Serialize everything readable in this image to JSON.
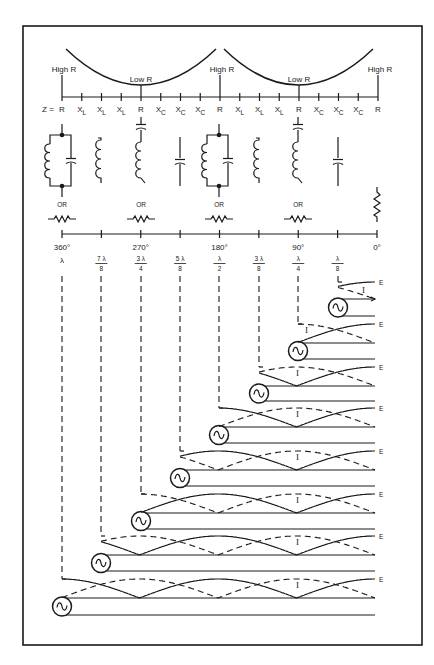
{
  "impedance_curve": {
    "high_label": "High R",
    "low_label": "Low R",
    "z_prefix": "Z =",
    "axis_labels": [
      "R",
      "X_L",
      "X_L",
      "X_L",
      "R",
      "X_C",
      "X_C",
      "X_C",
      "R",
      "X_L",
      "X_L",
      "X_L",
      "R",
      "X_C",
      "X_C",
      "X_C",
      "R"
    ]
  },
  "equivalents": {
    "or_label": "OR",
    "items": [
      {
        "position": "360°",
        "type": "parallel-LC",
        "alt": "resistor"
      },
      {
        "position": "315°",
        "type": "inductor"
      },
      {
        "position": "270°",
        "type": "series-LC",
        "alt": "resistor"
      },
      {
        "position": "225°",
        "type": "capacitor"
      },
      {
        "position": "180°",
        "type": "parallel-LC",
        "alt": "resistor"
      },
      {
        "position": "135°",
        "type": "inductor"
      },
      {
        "position": "90°",
        "type": "series-LC",
        "alt": "resistor"
      },
      {
        "position": "45°",
        "type": "capacitor"
      },
      {
        "position": "0°",
        "type": "resistor"
      }
    ]
  },
  "degree_axis": {
    "degrees": [
      "360°",
      "270°",
      "180°",
      "90°",
      "0°"
    ],
    "lengths": [
      {
        "num": "λ",
        "den": ""
      },
      {
        "num": "7 λ",
        "den": "8"
      },
      {
        "num": "3 λ",
        "den": "4"
      },
      {
        "num": "5 λ",
        "den": "8"
      },
      {
        "num": "λ",
        "den": "2"
      },
      {
        "num": "3 λ",
        "den": "8"
      },
      {
        "num": "λ",
        "den": "4"
      },
      {
        "num": "λ",
        "den": "8"
      }
    ]
  },
  "lines": {
    "voltage_label": "E",
    "current_label": "I",
    "rows": [
      {
        "length": "λ/8"
      },
      {
        "length": "λ/4"
      },
      {
        "length": "3λ/8"
      },
      {
        "length": "λ/2"
      },
      {
        "length": "5λ/8"
      },
      {
        "length": "3λ/4"
      },
      {
        "length": "7λ/8"
      },
      {
        "length": "λ"
      }
    ]
  }
}
